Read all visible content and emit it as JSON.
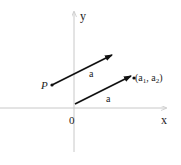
{
  "diagram": {
    "axes": {
      "x_label": "x",
      "y_label": "y",
      "origin_label": "0",
      "axis_color": "#c8c8c8"
    },
    "vectors": [
      {
        "name": "translated-vector",
        "label": "a",
        "start_label": "P",
        "from": [
          52,
          85
        ],
        "to": [
          112,
          55
        ]
      },
      {
        "name": "position-vector",
        "label": "a",
        "end_label_base": "(a",
        "end_label_sub1": "1",
        "end_label_mid": ", a",
        "end_label_sub2": "2",
        "end_label_close": ")",
        "from": [
          75,
          104
        ],
        "to": [
          133,
          76
        ]
      }
    ],
    "vector_color": "#111111"
  }
}
